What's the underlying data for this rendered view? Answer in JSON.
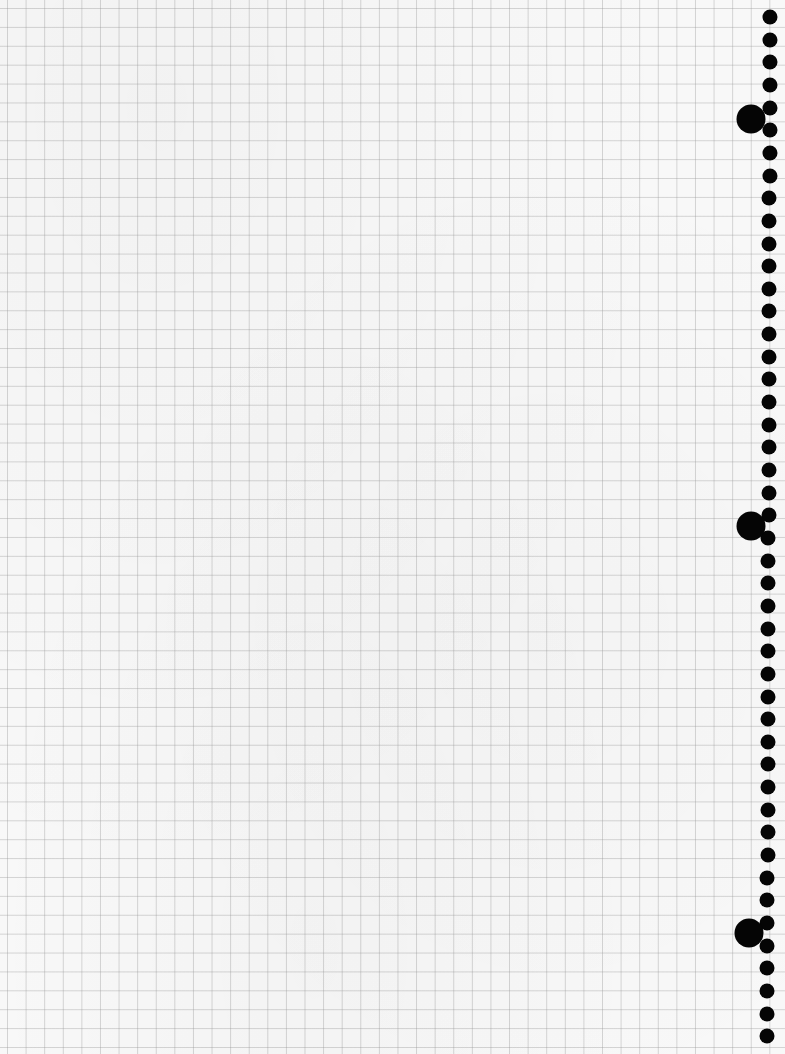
{
  "image": {
    "subject": "graph paper sheet with spiral binding holes",
    "width": 785,
    "height": 1054
  },
  "colors": {
    "paper": "#f8f8f8",
    "grid_line": "#d4d4d4",
    "hole": "#050505"
  },
  "grid": {
    "cell_width_px": 18.6,
    "cell_height_px": 18.9,
    "offset_x": 7,
    "offset_y": 8
  },
  "binding": {
    "side": "right",
    "small_holes": {
      "count": 46,
      "diameter": 15,
      "x_top": 770,
      "x_bottom": 767,
      "y_first": 17,
      "spacing": 22.65
    },
    "large_holes": [
      {
        "x": 751,
        "y": 119,
        "diameter": 29
      },
      {
        "x": 751,
        "y": 526,
        "diameter": 29
      },
      {
        "x": 749,
        "y": 933,
        "diameter": 29
      }
    ]
  }
}
